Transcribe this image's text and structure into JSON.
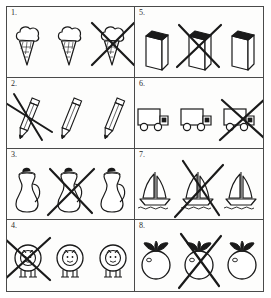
{
  "worksheet": {
    "title": "Cross out the odd one out",
    "grid": {
      "columns": 2,
      "rows": 4,
      "total_cells": 8
    },
    "ink_color": "#1a1a1a",
    "border_color": "#4a4a4a",
    "paper_color": "#fdfdfc",
    "cells": [
      {
        "label": "1.",
        "icon": "ice-cream-cone-icon",
        "subject": "ice cream cone",
        "count": 3,
        "crossed_index": 2,
        "crossed_positions": [
          3
        ]
      },
      {
        "label": "5.",
        "icon": "book-icon",
        "subject": "book",
        "count": 3,
        "crossed_index": 1,
        "crossed_positions": [
          2
        ]
      },
      {
        "label": "2.",
        "icon": "pencil-icon",
        "subject": "pencil",
        "count": 3,
        "crossed_index": 0,
        "crossed_positions": [
          1
        ]
      },
      {
        "label": "6.",
        "icon": "truck-icon",
        "subject": "truck",
        "count": 3,
        "crossed_index": 2,
        "crossed_positions": [
          3
        ]
      },
      {
        "label": "3.",
        "icon": "pitcher-icon",
        "subject": "pitcher",
        "count": 3,
        "crossed_index": 1,
        "crossed_positions": [
          2
        ]
      },
      {
        "label": "7.",
        "icon": "sailboat-icon",
        "subject": "sailboat",
        "count": 3,
        "crossed_index": 1,
        "crossed_positions": [
          2
        ]
      },
      {
        "label": "4.",
        "icon": "sheep-icon",
        "subject": "sheep",
        "count": 3,
        "crossed_index": 0,
        "crossed_positions": [
          1
        ]
      },
      {
        "label": "8.",
        "icon": "apple-icon",
        "subject": "apple",
        "count": 3,
        "crossed_index": 1,
        "crossed_positions": [
          2
        ]
      }
    ]
  }
}
